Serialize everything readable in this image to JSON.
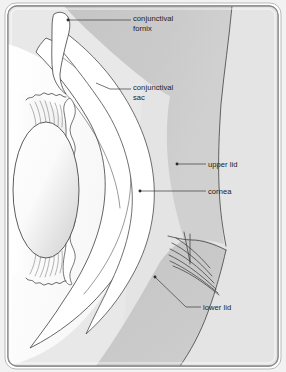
{
  "figure": {
    "kind": "anatomical-cross-section",
    "canvas": {
      "width": 286,
      "height": 372
    },
    "frame": {
      "outer_background": "#f2f2f2",
      "border_color": "#8c8c8c",
      "border_highlight": "#ffffff",
      "corner_radius": 10
    }
  },
  "palette": {
    "page_background": "#f2f2f2",
    "plate_light": "#e9e9e9",
    "tissue_gray": "#c9c9c9",
    "tissue_gray_dark": "#bdbdbd",
    "tissue_gray_light": "#d8d8d8",
    "white_structure": "#ffffff",
    "lens_light": "#fbfbfb",
    "lens_shade": "#d2d2d2",
    "outline_stroke": "#4a4a4a",
    "leader_stroke": "#3a3a3a",
    "label_color": "#1b1b1b",
    "lash_color": "#3d3d3d"
  },
  "labels": [
    {
      "id": "conjunctival-fornix",
      "line1": "conjunctival",
      "line2": "fornix",
      "text_x": 133,
      "text_y1": 21,
      "text_y2": 31,
      "leader": "M 131 20 L 68 20",
      "dot_x": 68,
      "dot_y": 20,
      "has_dot": true
    },
    {
      "id": "conjunctival-sac",
      "line1": "conjunctival",
      "line2": "sac",
      "text_x": 133,
      "text_y1": 90,
      "text_y2": 100,
      "leader": "M 131 89 L 110 89 L 96 83",
      "dot_x": 96,
      "dot_y": 83,
      "has_dot": false
    },
    {
      "id": "upper-lid",
      "line1": "upper lid",
      "line2": "",
      "text_x": 208,
      "text_y1": 167,
      "text_y2": 0,
      "leader": "M 206 164 L 177 164",
      "dot_x": 177,
      "dot_y": 164,
      "has_dot": true
    },
    {
      "id": "cornea",
      "line1": "cornea",
      "line2": "",
      "text_x": 208,
      "text_y1": 194,
      "text_y2": 0,
      "leader": "M 206 191 L 140 191",
      "dot_x": 140,
      "dot_y": 191,
      "has_dot": true
    },
    {
      "id": "lower-lid",
      "line1": "lower lid",
      "line2": "",
      "text_x": 203,
      "text_y1": 310,
      "text_y2": 0,
      "leader": "M 201 307 L 186 307 L 155 277",
      "dot_x": 155,
      "dot_y": 277,
      "has_dot": true
    }
  ],
  "structures": [
    {
      "id": "upper-eyelid",
      "label": "upper lid"
    },
    {
      "id": "lower-eyelid",
      "label": "lower lid"
    },
    {
      "id": "cornea",
      "label": "cornea"
    },
    {
      "id": "conjunctival-sac",
      "label": "conjunctival sac"
    },
    {
      "id": "conjunctival-fornix",
      "label": "conjunctival fornix"
    },
    {
      "id": "lens",
      "label": "lens"
    },
    {
      "id": "iris",
      "label": "iris"
    },
    {
      "id": "ciliary-body",
      "label": "ciliary body"
    },
    {
      "id": "sclera",
      "label": "sclera"
    },
    {
      "id": "eyelashes",
      "label": "eyelashes"
    }
  ]
}
